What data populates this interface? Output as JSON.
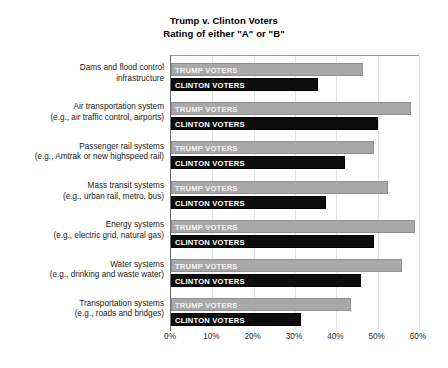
{
  "chart_data": {
    "type": "bar",
    "orientation": "horizontal",
    "title": "Trump v. Clinton Voters\nRating of either \"A\" or \"B\"",
    "title_lines": [
      "Trump v. Clinton Voters",
      "Rating of either \"A\" or \"B\""
    ],
    "xlabel": "",
    "ylabel": "",
    "xlim": [
      0,
      60
    ],
    "xtick_labels": [
      "0%",
      "10%",
      "20%",
      "30%",
      "40%",
      "50%",
      "60%"
    ],
    "xtick_values": [
      0,
      10,
      20,
      30,
      40,
      50,
      60
    ],
    "grid": true,
    "grid_axis": "x",
    "legend_position": "in-bar-labels",
    "categories": [
      "Dams and flood control infrastructure",
      "Air transportation system (e.g., air traffic control, airports)",
      "Passenger rail systems (e.g., Amtrak or new highspeed rail)",
      "Mass transit systems (e.g., urban rail, metro, bus)",
      "Energy systems (e.g., electric grid, natural gas)",
      "Water systems (e.g., drinking and waste water)",
      "Transportation systems (e.g., roads and bridges)"
    ],
    "category_lines": [
      [
        "Dams and flood control",
        "infrastructure"
      ],
      [
        "Air transportation system",
        "(e.g., air traffic control, airports)"
      ],
      [
        "Passenger rail systems",
        "(e.g., Amtrak or new highspeed rail)"
      ],
      [
        "Mass transit systems",
        "(e.g., urban rail, metro, bus)"
      ],
      [
        "Energy systems",
        "(e.g., electric grid, natural gas)"
      ],
      [
        "Water systems",
        "(e.g., drinking and waste water)"
      ],
      [
        "Transportation systems",
        "(e.g., roads and bridges)"
      ]
    ],
    "series": [
      {
        "name": "TRUMP VOTERS",
        "color": "#a8a8a8",
        "values": [
          46.5,
          58.0,
          49.0,
          52.5,
          59.0,
          56.0,
          43.5
        ]
      },
      {
        "name": "CLINTON VOTERS",
        "color": "#0d0d0d",
        "values": [
          35.5,
          50.0,
          42.0,
          37.5,
          49.0,
          46.0,
          31.5
        ]
      }
    ]
  },
  "colors": {
    "trump_bar": "#a8a8a8",
    "clinton_bar": "#0d0d0d",
    "gridline": "#e3e3e3",
    "axis": "#6d6d6d",
    "background": "#ffffff"
  }
}
